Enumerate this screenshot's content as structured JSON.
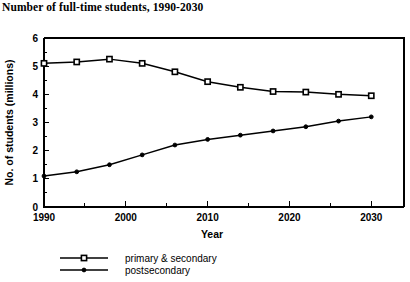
{
  "chart_data": {
    "type": "line",
    "title": "Number of full-time students, 1990-2030",
    "xlabel": "Year",
    "ylabel": "No. of students  (millions)",
    "x": [
      1990,
      1994,
      1998,
      2002,
      2006,
      2010,
      2014,
      2018,
      2022,
      2026,
      2030
    ],
    "xlim": [
      1990,
      2034
    ],
    "ylim": [
      0,
      6
    ],
    "xticks": [
      1990,
      1995,
      2000,
      2005,
      2010,
      2015,
      2020,
      2025,
      2030
    ],
    "xtick_labels": [
      "1990",
      "",
      "2000",
      "",
      "2010",
      "",
      "2020",
      "",
      "2030"
    ],
    "yticks": [
      0,
      1,
      2,
      3,
      4,
      5,
      6
    ],
    "ytick_labels": [
      "0",
      "1",
      "2",
      "3",
      "4",
      "5",
      "6"
    ],
    "grid": false,
    "legend_position": "below-left",
    "series": [
      {
        "name": "primary & secondary",
        "marker": "open-square",
        "values": [
          5.1,
          5.15,
          5.25,
          5.1,
          4.8,
          4.45,
          4.25,
          4.1,
          4.08,
          4.0,
          3.95
        ]
      },
      {
        "name": "postsecondary",
        "marker": "filled-dot",
        "values": [
          1.1,
          1.25,
          1.5,
          1.85,
          2.2,
          2.4,
          2.55,
          2.7,
          2.85,
          3.05,
          3.2
        ]
      }
    ]
  },
  "legend": {
    "entries": [
      {
        "label": "primary & secondary"
      },
      {
        "label": "postsecondary"
      }
    ]
  },
  "colors": {
    "ink": "#000000",
    "paper": "#ffffff"
  }
}
